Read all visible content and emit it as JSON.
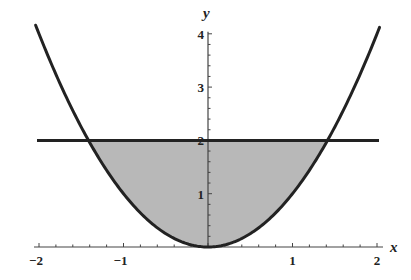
{
  "chart_data": {
    "type": "area",
    "title": "",
    "xlabel": "x",
    "ylabel": "y",
    "xlim": [
      -2,
      2
    ],
    "ylim": [
      0,
      4
    ],
    "grid": false,
    "legend": null,
    "x_ticks": [
      -2,
      -1,
      1,
      2
    ],
    "x_tick_labels": [
      "−2",
      "−1",
      "1",
      "2"
    ],
    "y_ticks": [
      1,
      2,
      3,
      4
    ],
    "y_tick_labels": [
      "1",
      "2",
      "3",
      "4"
    ],
    "series": [
      {
        "name": "y = x^2",
        "kind": "curve",
        "x_range": [
          -2,
          2
        ],
        "formula": "x^2",
        "color": "#222222"
      },
      {
        "name": "y = 2",
        "kind": "horizontal-line",
        "y": 2,
        "x_range": [
          -2,
          2
        ],
        "color": "#222222"
      }
    ],
    "shaded_region": {
      "description": "region between y = x^2 and y = 2",
      "x_range": [
        -1.414,
        1.414
      ],
      "lower": "x^2",
      "upper": 2,
      "color": "#b8b8b8"
    }
  },
  "colors": {
    "curve": "#222222",
    "shade": "#b8b8b8",
    "axis": "#444444",
    "background": "#ffffff"
  }
}
